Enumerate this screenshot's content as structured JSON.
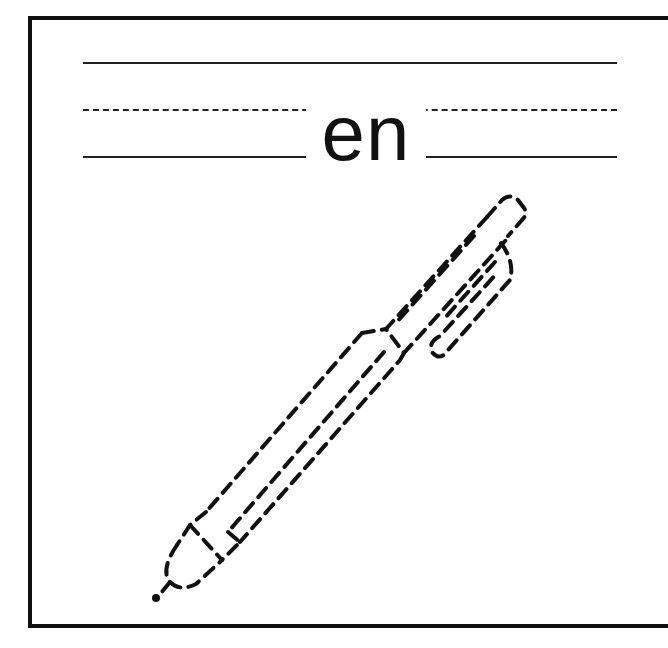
{
  "worksheet": {
    "word": "en",
    "image_subject": "pen",
    "style": "tracing worksheet with dashed outline illustration",
    "guide_lines": [
      "top-solid",
      "middle-dashed",
      "baseline-solid"
    ]
  }
}
